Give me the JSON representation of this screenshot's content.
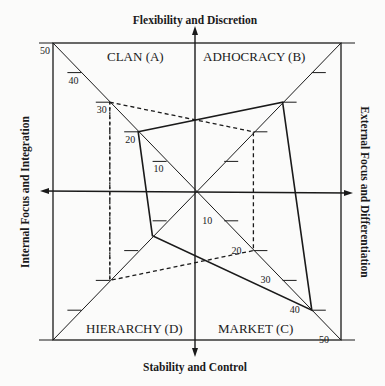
{
  "diagram": {
    "type": "competing-values-profile",
    "axes": {
      "top": "Flexibility and Discretion",
      "bottom": "Stability and Control",
      "left": "Internal Focus and Integration",
      "right": "External Focus and Differentiation"
    },
    "quadrants": {
      "A": "CLAN (A)",
      "B": "ADHOCRACY (B)",
      "C": "MARKET (C)",
      "D": "HIERARCHY (D)"
    },
    "scale": {
      "min": 0,
      "max": 50,
      "ticks": [
        10,
        20,
        30,
        40,
        50
      ]
    },
    "tick_labels": {
      "A": [
        "10",
        "20",
        "30",
        "40",
        "50"
      ],
      "C": [
        "10",
        "20",
        "30",
        "40",
        "50"
      ]
    },
    "profiles": [
      {
        "name": "solid",
        "style": "solid",
        "color": "#1a1a1a",
        "values": {
          "A": 20,
          "B": 30,
          "C": 40,
          "D": 15
        }
      },
      {
        "name": "dashed",
        "style": "dashed",
        "color": "#1a1a1a",
        "values": {
          "A": 30,
          "B": 20,
          "C": 20,
          "D": 30
        }
      }
    ]
  }
}
